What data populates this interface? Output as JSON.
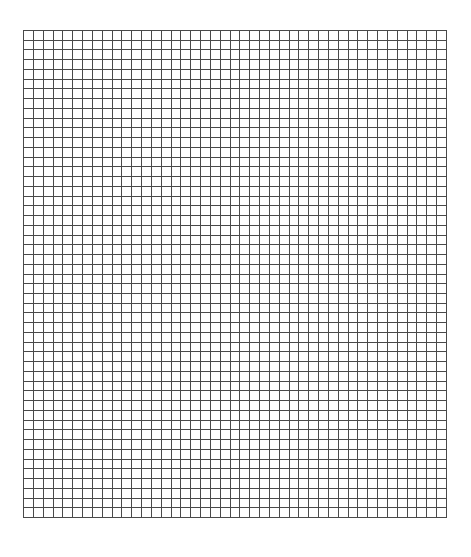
{
  "grid": {
    "columns": 43,
    "rows": 50,
    "left": 23,
    "top": 30,
    "width": 423,
    "height": 487,
    "line_color": "#4a4a4a",
    "background": "#ffffff"
  }
}
